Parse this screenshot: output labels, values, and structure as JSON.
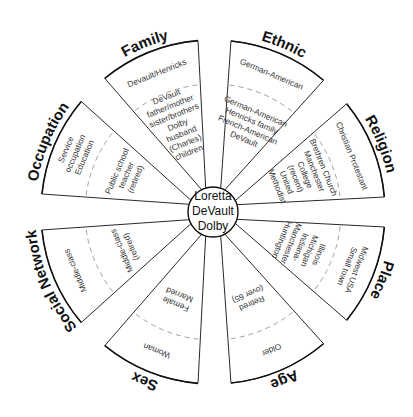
{
  "center": {
    "lines": [
      "Loretta",
      "DeVault",
      "Dolby"
    ]
  },
  "petals": [
    {
      "category": "Family",
      "angle": -112,
      "outer": [
        "Devault/Henricks"
      ],
      "inner": [
        "DeVault",
        "father/mother",
        "sister/brothers",
        "Dolby",
        "husband",
        "(Charles)",
        "children"
      ]
    },
    {
      "category": "Ethnic",
      "angle": -67,
      "outer": [
        "German-American"
      ],
      "inner": [
        "German-American",
        "Henricks family",
        "French-American",
        "DeVault"
      ]
    },
    {
      "category": "Religion",
      "angle": -22,
      "outer": [
        "Christian Protestant"
      ],
      "inner": [
        "Brethren Church",
        "Manchester",
        "College",
        "(recent)",
        "United",
        "Methodist"
      ]
    },
    {
      "category": "Place",
      "angle": 22,
      "outer": [
        "Midwest USA",
        "Small town"
      ],
      "inner": [
        "Illinois",
        "Michigan",
        "Indiana-",
        "Manchester",
        "Huntington"
      ]
    },
    {
      "category": "Age",
      "angle": 67,
      "outer": [
        "Older"
      ],
      "inner": [
        "Retired",
        "(over 65)"
      ]
    },
    {
      "category": "Sex",
      "angle": 112,
      "outer": [
        "Woman"
      ],
      "inner": [
        "Female",
        "Married"
      ]
    },
    {
      "category": "Social Network",
      "angle": 157,
      "outer": [
        "Middle-class"
      ],
      "inner": [
        "Middle-class",
        "(retired)"
      ]
    },
    {
      "category": "Occupation",
      "angle": -157,
      "outer": [
        "Service",
        "occupation",
        "Education"
      ],
      "inner": [
        "Public school",
        "teacher",
        "(retired)"
      ]
    }
  ]
}
